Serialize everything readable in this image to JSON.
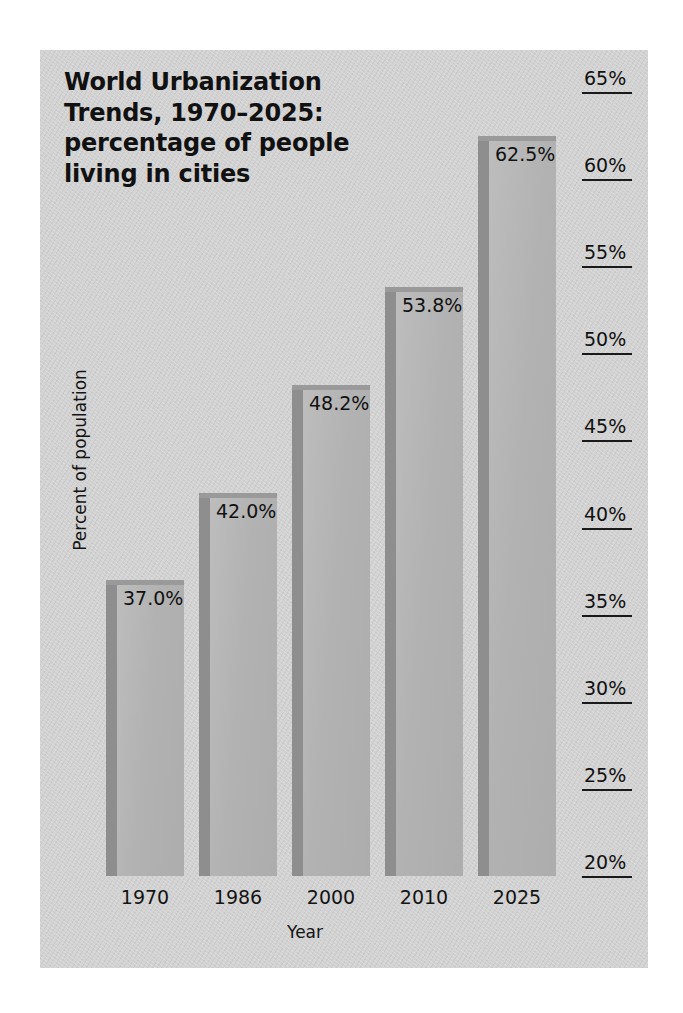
{
  "chart_data": {
    "type": "bar",
    "title": "World Urbanization\nTrends, 1970–2025:\npercentage of people\nliving in cities",
    "xlabel": "Year",
    "ylabel": "Percent of population",
    "categories": [
      "1970",
      "1986",
      "2000",
      "2010",
      "2025"
    ],
    "values": [
      37.0,
      42.0,
      48.2,
      53.8,
      62.5
    ],
    "value_labels": [
      "37.0%",
      "42.0%",
      "48.2%",
      "53.8%",
      "62.5%"
    ],
    "ylim": [
      20,
      65
    ],
    "ytick_values": [
      20,
      25,
      30,
      35,
      40,
      45,
      50,
      55,
      60,
      65
    ],
    "ytick_labels": [
      "20%",
      "25%",
      "30%",
      "35%",
      "40%",
      "45%",
      "50%",
      "55%",
      "60%",
      "65%"
    ],
    "ytick_side": "right",
    "grid": false,
    "legend": false,
    "bar_style": "3d-extruded",
    "colors": {
      "panel_background": "#d2d2d2",
      "bar_face": "#b3b3b3",
      "bar_side": "#8e8e8e",
      "bar_top": "#9a9a9a",
      "text": "#111111",
      "page_background": "#ffffff"
    }
  }
}
